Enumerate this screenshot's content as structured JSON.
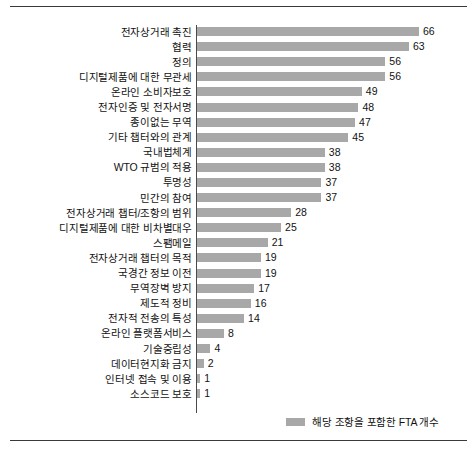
{
  "chart_data": {
    "type": "bar",
    "orientation": "horizontal",
    "title": "",
    "subtitle": "",
    "xlabel": "",
    "ylabel": "",
    "grid": false,
    "legend_position": "bottom-right",
    "xlim": [
      0,
      66
    ],
    "categories": [
      "전자상거래 촉진",
      "협력",
      "정의",
      "디지털제품에 대한 무관세",
      "온라인 소비자보호",
      "전자인증 및 전자서명",
      "종이없는 무역",
      "기타 챕터와의 관계",
      "국내법체계",
      "WTO 규범의 적용",
      "투명성",
      "민간의 참여",
      "전자상거래 챕터/조항의 범위",
      "디지털제품에 대한 비차별대우",
      "스팸메일",
      "전자상거래 챕터의 목적",
      "국경간 정보 이전",
      "무역장벽 방지",
      "제도적 정비",
      "전자적 전송의 특성",
      "온라인 플랫폼서비스",
      "기술중립성",
      "데이터현지화 금지",
      "인터넷 접속 및 이용",
      "소스코드 보호"
    ],
    "values": [
      66,
      63,
      56,
      56,
      49,
      48,
      47,
      45,
      38,
      38,
      37,
      37,
      28,
      25,
      21,
      19,
      19,
      17,
      16,
      14,
      8,
      4,
      2,
      1,
      1
    ],
    "series": [
      {
        "name": "해당 조항을 포함한 FTA 개수",
        "values": [
          66,
          63,
          56,
          56,
          49,
          48,
          47,
          45,
          38,
          38,
          37,
          37,
          28,
          25,
          21,
          19,
          19,
          17,
          16,
          14,
          8,
          4,
          2,
          1,
          1
        ]
      }
    ],
    "legend": [
      "해당 조항을 포함한 FTA 개수"
    ],
    "bar_color": "#a8a8a8",
    "axis_color": "#4a4a4a",
    "text_color": "#111111"
  },
  "legend": {
    "label": "해당 조항을 포함한 FTA 개수"
  }
}
